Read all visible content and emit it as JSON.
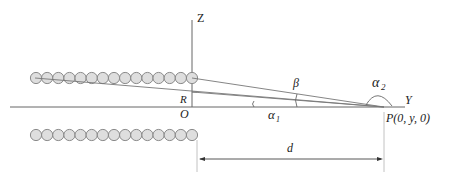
{
  "figure": {
    "type": "geometry-diagram",
    "labels": {
      "z_axis": "Z",
      "y_axis": "Y",
      "origin": "O",
      "radius": "R",
      "point": "P(0, y, 0)",
      "distance": "d",
      "angle_beta": "β",
      "angle_alpha1": "α",
      "angle_alpha1_sub": "1",
      "angle_alpha2": "α",
      "angle_alpha2_sub": "2"
    },
    "rows": {
      "upper_count": 15,
      "lower_count": 15
    },
    "colors": {
      "bead_fill": "#dedede",
      "bead_stroke": "#8a8a8a",
      "line": "#666666"
    }
  }
}
